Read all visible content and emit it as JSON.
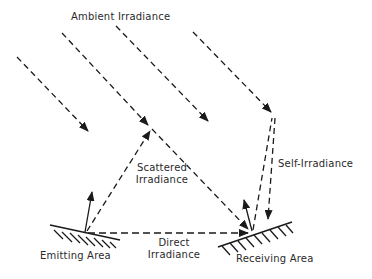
{
  "diagram": {
    "type": "radiative-exchange-schematic",
    "labels": {
      "ambient": "Ambient Irradiance",
      "scattered_line1": "Scattered",
      "scattered_line2": "Irradiance",
      "self": "Self-Irradiance",
      "direct_line1": "Direct",
      "direct_line2": "Irradiance",
      "emitting": "Emitting Area",
      "receiving": "Receiving Area"
    },
    "nodes": [
      {
        "id": "emitting-point",
        "x": 85,
        "y": 233
      },
      {
        "id": "scatter-point",
        "x": 150,
        "y": 128
      },
      {
        "id": "self-point",
        "x": 272,
        "y": 115
      },
      {
        "id": "receiving-point",
        "x": 252,
        "y": 232
      }
    ],
    "edges": [
      {
        "from": "ambient",
        "to": "space",
        "style": "dashed"
      },
      {
        "from": "ambient",
        "to": "scatter-point",
        "style": "dashed"
      },
      {
        "from": "ambient",
        "to": "space",
        "style": "dashed"
      },
      {
        "from": "ambient",
        "to": "self-point",
        "style": "dashed"
      },
      {
        "from": "emitting-point",
        "to": "scatter-point",
        "style": "dashed",
        "label": "Scattered Irradiance"
      },
      {
        "from": "scatter-point",
        "to": "receiving-point",
        "style": "dashed"
      },
      {
        "from": "emitting-point",
        "to": "receiving-point",
        "style": "dashed",
        "label": "Direct Irradiance"
      },
      {
        "from": "receiving-point",
        "to": "self-point",
        "style": "dashed",
        "label": "Self-Irradiance"
      },
      {
        "from": "self-point",
        "to": "receiving-point",
        "style": "dashed"
      }
    ],
    "colors": {
      "ink": "#1a1a1a",
      "background": "#ffffff"
    }
  }
}
